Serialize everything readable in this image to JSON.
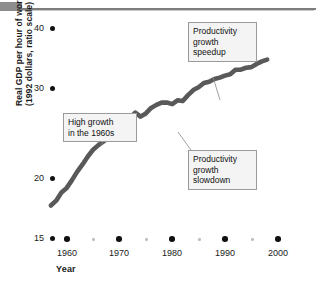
{
  "chart_data": {
    "type": "line",
    "title": "",
    "xlabel": "Year",
    "ylabel": "Real GDP per hour of work\n(1992 dollars, ratio scale)",
    "scale": "ratio (logarithmic) y-axis",
    "grid": false,
    "legend": null,
    "xlim": [
      1957,
      1999
    ],
    "ylim": [
      15,
      42
    ],
    "xticks": [
      1960,
      1970,
      1980,
      1990,
      2000
    ],
    "xticklabels": [
      "1960",
      "1970",
      "1980",
      "1990",
      "2000"
    ],
    "xticks_minor": [
      1965,
      1975,
      1985,
      1995
    ],
    "yticks": [
      15,
      20,
      30,
      40
    ],
    "yticklabels": [
      "15",
      "20",
      "30",
      "40"
    ],
    "series": [
      {
        "name": "Real GDP per hour of work",
        "color": "#595959",
        "x": [
          1957,
          1958,
          1959,
          1960,
          1961,
          1962,
          1963,
          1964,
          1965,
          1966,
          1967,
          1968,
          1969,
          1970,
          1971,
          1972,
          1973,
          1974,
          1975,
          1976,
          1977,
          1978,
          1979,
          1980,
          1981,
          1982,
          1983,
          1984,
          1985,
          1986,
          1987,
          1988,
          1989,
          1990,
          1991,
          1992,
          1993,
          1994,
          1995,
          1996,
          1997,
          1998
        ],
        "y": [
          17.5,
          17.9,
          18.6,
          19.0,
          19.7,
          20.5,
          21.2,
          22.0,
          22.7,
          23.2,
          23.6,
          24.3,
          24.5,
          24.8,
          25.6,
          26.3,
          27.0,
          26.5,
          26.9,
          27.6,
          28.0,
          28.3,
          28.3,
          28.1,
          28.6,
          28.5,
          29.3,
          30.0,
          30.4,
          31.0,
          31.2,
          31.6,
          31.8,
          32.1,
          32.3,
          33.0,
          33.0,
          33.3,
          33.4,
          33.9,
          34.3,
          34.6
        ]
      }
    ],
    "annotations": [
      {
        "id": "high-growth",
        "text": "High growth\nin the 1960s",
        "points_to_year": 1966,
        "points_to_value": 23.2
      },
      {
        "id": "productivity-growth-slowdown",
        "text": "Productivity\ngrowth\nslowdown",
        "points_to_year": 1974,
        "points_to_value": 26.5
      },
      {
        "id": "productivity-growth-speedup",
        "text": "Productivity\ngrowth\nspeedup",
        "points_to_year": 1987,
        "points_to_value": 31.2
      }
    ]
  },
  "axes": {
    "y_title": "Real GDP per hour of work\n(1992 dollars, ratio scale)",
    "x_title": "Year",
    "y_labels": [
      "40",
      "30",
      "20",
      "15"
    ],
    "x_labels": [
      "1960",
      "1970",
      "1980",
      "1990",
      "2000"
    ]
  },
  "callouts": {
    "high_growth": "High growth\nin the 1960s",
    "slowdown": "Productivity\ngrowth\nslowdown",
    "speedup": "Productivity\ngrowth\nspeedup"
  },
  "colors": {
    "line": "#595959",
    "callout_fill": "#f4f4f4",
    "callout_border": "#9a9a9a",
    "tick_dot": "#111111",
    "minor_dot": "#bdbdbd",
    "top_bar": "#8d8d8d"
  }
}
